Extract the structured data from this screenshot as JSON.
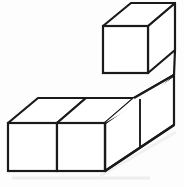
{
  "figure": {
    "title": "Isometric cube stack figure",
    "cube_count": 4,
    "style": {
      "background_color": "#fdfdfd",
      "line_color": "#1a1a1a",
      "face_color": "#ffffff",
      "shadow_color": "#eaeaea",
      "stroke_width": 2.2,
      "thin_stroke_width": 1.8
    },
    "projection": {
      "cube_width": 97,
      "cube_height": 48,
      "depth_dx": 30,
      "depth_dy": -25,
      "unit_width": 48.5
    },
    "cubes": [
      {
        "id": "base-front-left",
        "label": "Front left base cube",
        "position": [
          0,
          0,
          0
        ],
        "front_face": {
          "x1": 8,
          "y1": 123,
          "x2": 57,
          "y2": 171
        },
        "visible_faces": [
          "front",
          "top"
        ]
      },
      {
        "id": "base-front-right",
        "label": "Front right base cube",
        "position": [
          1,
          0,
          0
        ],
        "front_face": {
          "x1": 57,
          "y1": 123,
          "x2": 105,
          "y2": 171
        },
        "visible_faces": [
          "front",
          "top"
        ]
      },
      {
        "id": "base-back",
        "label": "Rear base cube",
        "position": [
          2,
          0,
          0
        ],
        "front_face": {
          "x1": 105,
          "y1": 123,
          "x2": 153,
          "y2": 171
        },
        "visible_faces": [
          "top",
          "right"
        ]
      },
      {
        "id": "stacked-top",
        "label": "Top stacked cube",
        "position": [
          2,
          1,
          0
        ],
        "front_face": {
          "x1": 103,
          "y1": 26,
          "x2": 148,
          "y2": 73
        },
        "visible_faces": [
          "front",
          "top",
          "right"
        ]
      }
    ],
    "vertices": {
      "base_front_bottom_left": [
        8,
        171
      ],
      "base_front_top_left": [
        8,
        123
      ],
      "base_mid_bottom": [
        57,
        171
      ],
      "base_mid_top": [
        57,
        123
      ],
      "base_front_bottom_right": [
        105,
        171
      ],
      "base_front_top_right": [
        105,
        123
      ],
      "base_back_top_left": [
        38,
        98
      ],
      "base_back_top_mid": [
        86,
        98
      ],
      "base_back_top_right": [
        134,
        98
      ],
      "base_right_bottom_back": [
        174,
        125
      ],
      "base_right_top_back": [
        174,
        75
      ],
      "top_cube_front_tl": [
        103,
        26
      ],
      "top_cube_front_tr": [
        148,
        26
      ],
      "top_cube_front_bl": [
        103,
        73
      ],
      "top_cube_front_br": [
        148,
        73
      ],
      "top_cube_back_tl": [
        131,
        3
      ],
      "top_cube_back_tr": [
        175,
        3
      ],
      "top_cube_back_br": [
        175,
        50
      ]
    }
  }
}
